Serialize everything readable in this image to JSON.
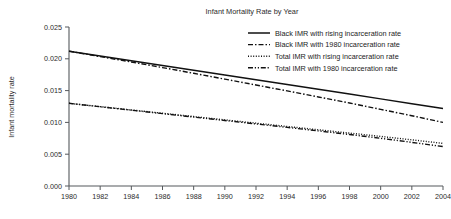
{
  "chart_data": {
    "type": "line",
    "title": "Infant Mortality Rate by Year",
    "xlabel": "",
    "ylabel": "Infant mortality rate",
    "x": [
      1980,
      1982,
      1984,
      1986,
      1988,
      1990,
      1992,
      1994,
      1996,
      1998,
      2000,
      2002,
      2004
    ],
    "xlim": [
      1980,
      2004
    ],
    "ylim": [
      0.0,
      0.025
    ],
    "xticks": [
      "1980",
      "1982",
      "1984",
      "1986",
      "1988",
      "1990",
      "1992",
      "1994",
      "1996",
      "1998",
      "2000",
      "2002",
      "2004"
    ],
    "yticks": [
      "0.000",
      "0.005",
      "0.010",
      "0.015",
      "0.020",
      "0.025"
    ],
    "ytick_values": [
      0.0,
      0.005,
      0.01,
      0.015,
      0.02,
      0.025
    ],
    "grid": false,
    "legend_position": "top-right",
    "series": [
      {
        "name": "Black IMR with rising incarceration rate",
        "style": "solid",
        "color": "#111111",
        "values": [
          0.0212,
          0.02045,
          0.0197,
          0.01895,
          0.0182,
          0.01745,
          0.0167,
          0.01595,
          0.0152,
          0.01445,
          0.0137,
          0.01295,
          0.0122
        ]
      },
      {
        "name": "Black IMR with 1980 incarceration rate",
        "style": "dash-dot",
        "color": "#111111",
        "values": [
          0.0212,
          0.02035,
          0.0195,
          0.01862,
          0.01772,
          0.0168,
          0.01588,
          0.01495,
          0.014,
          0.01305,
          0.01205,
          0.01105,
          0.01
        ]
      },
      {
        "name": "Total IMR with rising incarceration rate",
        "style": "dotted",
        "color": "#111111",
        "values": [
          0.013,
          0.01248,
          0.01196,
          0.01144,
          0.01092,
          0.0104,
          0.00988,
          0.00936,
          0.00884,
          0.00832,
          0.0078,
          0.00726,
          0.0067
        ]
      },
      {
        "name": "Total IMR with 1980 incarceration rate",
        "style": "dash-dot-dot",
        "color": "#111111",
        "values": [
          0.013,
          0.01246,
          0.01192,
          0.01138,
          0.01084,
          0.0103,
          0.00976,
          0.00922,
          0.00866,
          0.0081,
          0.0075,
          0.00686,
          0.0062
        ]
      }
    ]
  },
  "figure": {
    "title": "Infant Mortality Rate by Year",
    "y_axis_label": "Infant mortality rate",
    "legend": [
      {
        "label": "Black IMR with rising incarceration rate",
        "style": "solid"
      },
      {
        "label": "Black IMR with 1980 incarceration rate",
        "style": "dash-dot"
      },
      {
        "label": "Total IMR with rising incarceration rate",
        "style": "dotted"
      },
      {
        "label": "Total IMR with 1980 incarceration rate",
        "style": "dash-dot-dot"
      }
    ]
  }
}
